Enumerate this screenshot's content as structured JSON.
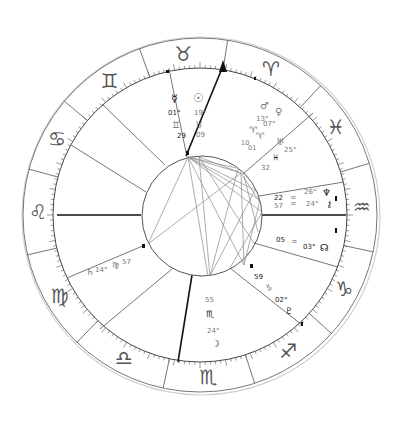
{
  "chart": {
    "type": "natal-chart-wheel",
    "colors": {
      "background": "#ffffff",
      "ring_line": "#555555",
      "house_line": "#666666",
      "axis_line": "#111111",
      "aspect_line": "#8a8a8a",
      "sign_glyph": "#555555"
    },
    "signs": [
      {
        "name": "Taurus",
        "glyph": "♉"
      },
      {
        "name": "Aries",
        "glyph": "♈"
      },
      {
        "name": "Pisces",
        "glyph": "♓"
      },
      {
        "name": "Aquarius",
        "glyph": "♒"
      },
      {
        "name": "Capricorn",
        "glyph": "♑"
      },
      {
        "name": "Sagittarius",
        "glyph": "♐"
      },
      {
        "name": "Scorpio",
        "glyph": "♏"
      },
      {
        "name": "Libra",
        "glyph": "♎"
      },
      {
        "name": "Virgo",
        "glyph": "♍"
      },
      {
        "name": "Leo",
        "glyph": "♌"
      },
      {
        "name": "Cancer",
        "glyph": "♋"
      },
      {
        "name": "Gemini",
        "glyph": "♊"
      }
    ],
    "planets": {
      "mercury": {
        "glyph": "☿",
        "degree": "01°",
        "sign_glyph": "♊",
        "minutes": "29"
      },
      "sun": {
        "glyph": "☉",
        "degree": "19°",
        "sign_glyph": "♉",
        "minutes": "09"
      },
      "mars": {
        "glyph": "♂",
        "degree": "13°",
        "sign_glyph": "♈",
        "minutes": "10"
      },
      "venus": {
        "glyph": "♀",
        "degree": "07°",
        "sign_glyph": "♈",
        "minutes": "01"
      },
      "uranus": {
        "glyph": "♅",
        "degree": "25°",
        "sign_glyph": "♓",
        "minutes": "32"
      },
      "neptune": {
        "glyph": "♆",
        "degree": "26°",
        "sign_glyph": "♒",
        "minutes": "22"
      },
      "chiron": {
        "glyph": "⚷",
        "degree": "24°",
        "sign_glyph": "♒",
        "minutes": "57"
      },
      "node": {
        "glyph": "☊",
        "degree": "03°",
        "sign_glyph": "♒",
        "minutes": "05"
      },
      "pluto": {
        "glyph": "♇",
        "degree": "02°",
        "sign_glyph": "♑",
        "minutes": "59"
      },
      "moon": {
        "glyph": "☽",
        "degree": "24°",
        "sign_glyph": "♏",
        "minutes": "55"
      },
      "saturn": {
        "glyph": "♄",
        "degree": "14°",
        "sign_glyph": "♍",
        "minutes": "57"
      }
    }
  }
}
